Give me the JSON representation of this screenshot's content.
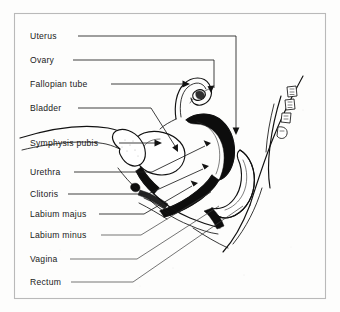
{
  "figure": {
    "background_color": "#fdfdfc",
    "frame_color": "#b9b9b9",
    "ink_color": "#111111"
  },
  "labels": [
    {
      "id": "uterus",
      "text": "Uterus"
    },
    {
      "id": "ovary",
      "text": "Ovary"
    },
    {
      "id": "fallopian-tube",
      "text": "Fallopian tube"
    },
    {
      "id": "bladder",
      "text": "Bladder"
    },
    {
      "id": "symphysis-pubis",
      "text": "Symphysis pubis"
    },
    {
      "id": "urethra",
      "text": "Urethra"
    },
    {
      "id": "clitoris",
      "text": "Clitoris"
    },
    {
      "id": "labium-majus",
      "text": "Labium majus"
    },
    {
      "id": "labium-minus",
      "text": "Labium minus"
    },
    {
      "id": "vagina",
      "text": "Vagina"
    },
    {
      "id": "rectum",
      "text": "Rectum"
    }
  ]
}
